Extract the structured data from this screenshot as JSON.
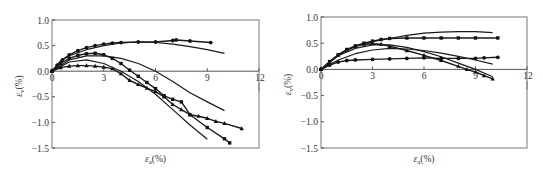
{
  "chart_data": [
    {
      "type": "line",
      "panel": "left",
      "title": "",
      "xlabel": "ε_a(%)",
      "ylabel": "ε_v(%)",
      "xlim": [
        0,
        12
      ],
      "ylim": [
        -1.5,
        1.0
      ],
      "xticks": [
        0,
        3,
        6,
        9,
        12
      ],
      "yticks": [
        1.0,
        0.5,
        0.0,
        -0.5,
        -1.0,
        -1.5
      ],
      "xtick_labels": [
        "0",
        "3",
        "6",
        "9",
        "12"
      ],
      "ytick_labels": [
        "1.0",
        "0.5",
        "0.0",
        "-0.5",
        "-1.0",
        "-1.5"
      ],
      "grid": false,
      "legend": null,
      "series": [
        {
          "name": "test-1 (circles)",
          "style": "markers",
          "marker": "circle",
          "x": [
            0,
            0.3,
            0.6,
            1.0,
            1.5,
            2.0,
            2.5,
            3.0,
            3.5,
            4.0,
            5.0,
            6.0,
            7.0,
            7.2,
            8.0,
            9.2
          ],
          "y": [
            0,
            0.12,
            0.22,
            0.32,
            0.4,
            0.46,
            0.5,
            0.53,
            0.55,
            0.56,
            0.57,
            0.57,
            0.6,
            0.61,
            0.59,
            0.56
          ]
        },
        {
          "name": "test-1 (model)",
          "style": "line",
          "x": [
            0,
            0.5,
            1.0,
            2.0,
            3.0,
            4.0,
            5.0,
            6.0,
            7.0,
            8.0,
            9.0,
            10.0
          ],
          "y": [
            0,
            0.2,
            0.3,
            0.42,
            0.5,
            0.55,
            0.57,
            0.56,
            0.53,
            0.48,
            0.42,
            0.35
          ]
        },
        {
          "name": "test-2 (squares)",
          "style": "markers",
          "marker": "square",
          "x": [
            0,
            0.5,
            1.0,
            1.5,
            2.0,
            2.5,
            3.0,
            3.5,
            4.0,
            4.5,
            5.0,
            5.5,
            6.0,
            6.5,
            7.0,
            7.5,
            8.0,
            9.0,
            10.0,
            10.3
          ],
          "y": [
            0,
            0.15,
            0.25,
            0.31,
            0.34,
            0.35,
            0.32,
            0.25,
            0.15,
            0.02,
            -0.1,
            -0.22,
            -0.34,
            -0.48,
            -0.55,
            -0.6,
            -0.85,
            -1.1,
            -1.32,
            -1.4
          ]
        },
        {
          "name": "test-3 (triangles)",
          "style": "markers",
          "marker": "triangle",
          "x": [
            0,
            0.5,
            1.0,
            1.5,
            2.0,
            2.5,
            3.0,
            3.5,
            4.0,
            4.5,
            5.0,
            5.5,
            6.0,
            6.5,
            7.0,
            7.5,
            8.0,
            8.5,
            9.0,
            9.5,
            10.0,
            11.0
          ],
          "y": [
            0,
            0.07,
            0.1,
            0.11,
            0.11,
            0.1,
            0.08,
            0.05,
            -0.05,
            -0.18,
            -0.26,
            -0.33,
            -0.4,
            -0.5,
            -0.65,
            -0.75,
            -0.85,
            -0.88,
            -0.92,
            -0.98,
            -1.02,
            -1.12
          ]
        },
        {
          "name": "test-2/3 (model A)",
          "style": "line",
          "x": [
            0,
            1.0,
            2.0,
            3.0,
            4.0,
            5.0,
            6.0,
            7.0,
            8.0,
            9.0,
            10.0
          ],
          "y": [
            0,
            0.22,
            0.3,
            0.3,
            0.25,
            0.15,
            0.0,
            -0.2,
            -0.42,
            -0.6,
            -0.77
          ]
        },
        {
          "name": "test-2/3 (model B)",
          "style": "line",
          "x": [
            0,
            1.0,
            2.0,
            3.0,
            4.0,
            5.0,
            6.0,
            7.0,
            8.0,
            9.0
          ],
          "y": [
            0,
            0.18,
            0.22,
            0.15,
            0.0,
            -0.2,
            -0.45,
            -0.75,
            -1.05,
            -1.33
          ]
        }
      ]
    },
    {
      "type": "line",
      "panel": "right",
      "title": "",
      "xlabel": "ε_a(%)",
      "ylabel": "ε_v(%)",
      "xlim": [
        0,
        12
      ],
      "ylim": [
        -1.5,
        1.0
      ],
      "xticks": [
        0,
        3,
        6,
        9,
        12
      ],
      "yticks": [
        1.0,
        0.5,
        0.0,
        -0.5,
        -1.0,
        -1.5
      ],
      "xtick_labels": [
        "0",
        "3",
        "6",
        "9",
        "12"
      ],
      "ytick_labels": [
        "1.0",
        "0.5",
        "0.0",
        "-0.5",
        "-1.0",
        "-1.5"
      ],
      "grid": false,
      "legend": null,
      "series": [
        {
          "name": "test-4 (squares)",
          "style": "markers",
          "marker": "square",
          "x": [
            0,
            0.5,
            1.0,
            1.5,
            2.0,
            2.5,
            3.0,
            3.5,
            4.0,
            5.0,
            6.0,
            7.0,
            8.0,
            9.0,
            10.3
          ],
          "y": [
            0,
            0.15,
            0.28,
            0.38,
            0.45,
            0.5,
            0.54,
            0.57,
            0.59,
            0.6,
            0.6,
            0.6,
            0.6,
            0.6,
            0.6
          ]
        },
        {
          "name": "test-4 (model)",
          "style": "line",
          "x": [
            0,
            1.0,
            2.0,
            3.0,
            4.0,
            5.0,
            6.0,
            7.0,
            8.0,
            9.0,
            10.0
          ],
          "y": [
            0,
            0.28,
            0.44,
            0.53,
            0.59,
            0.65,
            0.69,
            0.71,
            0.72,
            0.72,
            0.7
          ]
        },
        {
          "name": "test-5 (triangles)",
          "style": "markers",
          "marker": "triangle",
          "x": [
            0,
            0.5,
            1.0,
            1.5,
            2.0,
            2.5,
            3.0,
            3.5,
            4.0,
            5.0,
            6.0,
            7.0,
            8.0,
            8.5,
            9.0,
            9.5,
            10.0
          ],
          "y": [
            0,
            0.14,
            0.27,
            0.37,
            0.44,
            0.48,
            0.49,
            0.48,
            0.44,
            0.36,
            0.27,
            0.17,
            0.06,
            0.0,
            -0.05,
            -0.12,
            -0.18
          ]
        },
        {
          "name": "test-5 (model)",
          "style": "line",
          "x": [
            0,
            1.0,
            2.0,
            3.0,
            4.0,
            5.0,
            6.0,
            7.0,
            8.0,
            9.0,
            10.0
          ],
          "y": [
            0,
            0.26,
            0.4,
            0.47,
            0.47,
            0.42,
            0.34,
            0.24,
            0.12,
            0.0,
            -0.14
          ]
        },
        {
          "name": "test-6 (circles)",
          "style": "markers",
          "marker": "circle",
          "x": [
            0,
            0.5,
            1.0,
            1.5,
            2.0,
            3.0,
            4.0,
            5.0,
            6.0,
            7.0,
            8.0,
            9.0,
            9.5,
            10.3
          ],
          "y": [
            0,
            0.08,
            0.14,
            0.17,
            0.18,
            0.19,
            0.2,
            0.21,
            0.22,
            0.21,
            0.21,
            0.21,
            0.22,
            0.23
          ]
        },
        {
          "name": "test-6 (model)",
          "style": "line",
          "x": [
            0,
            1.0,
            2.0,
            3.0,
            4.0,
            5.0,
            6.0,
            7.0,
            8.0,
            9.0,
            10.0
          ],
          "y": [
            0,
            0.18,
            0.3,
            0.37,
            0.4,
            0.39,
            0.36,
            0.31,
            0.25,
            0.18,
            0.1
          ]
        }
      ]
    }
  ]
}
